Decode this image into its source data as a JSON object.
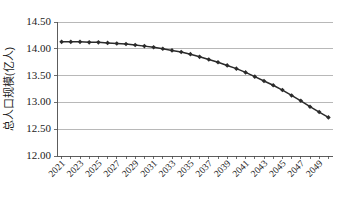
{
  "chart_data": {
    "type": "line",
    "title": "",
    "xlabel": "",
    "ylabel": "总人口规模(亿人)",
    "ylim": [
      12.0,
      14.5
    ],
    "ytick_labels": [
      "12.00",
      "12.50",
      "13.00",
      "13.50",
      "14.00",
      "14.50"
    ],
    "ytick_values": [
      12.0,
      12.5,
      13.0,
      13.5,
      14.0,
      14.5
    ],
    "grid": true,
    "legend": "none",
    "marker": "diamond",
    "line_color": "#2b2b2b",
    "grid_color": "#9a9a9a",
    "x": [
      2021,
      2022,
      2023,
      2024,
      2025,
      2026,
      2027,
      2028,
      2029,
      2030,
      2031,
      2032,
      2033,
      2034,
      2035,
      2036,
      2037,
      2038,
      2039,
      2040,
      2041,
      2042,
      2043,
      2044,
      2045,
      2046,
      2047,
      2048,
      2049,
      2050
    ],
    "xtick_labels": [
      "2021",
      "2023",
      "2025",
      "2027",
      "2029",
      "2031",
      "2033",
      "2035",
      "2037",
      "2039",
      "2041",
      "2043",
      "2045",
      "2047",
      "2049"
    ],
    "xtick_values": [
      2021,
      2023,
      2025,
      2027,
      2029,
      2031,
      2033,
      2035,
      2037,
      2039,
      2041,
      2043,
      2045,
      2047,
      2049
    ],
    "categories": [
      "2021",
      "2022",
      "2023",
      "2024",
      "2025",
      "2026",
      "2027",
      "2028",
      "2029",
      "2030",
      "2031",
      "2032",
      "2033",
      "2034",
      "2035",
      "2036",
      "2037",
      "2038",
      "2039",
      "2040",
      "2041",
      "2042",
      "2043",
      "2044",
      "2045",
      "2046",
      "2047",
      "2048",
      "2049",
      "2050"
    ],
    "values": [
      14.13,
      14.13,
      14.13,
      14.12,
      14.12,
      14.11,
      14.1,
      14.09,
      14.07,
      14.05,
      14.03,
      14.0,
      13.97,
      13.94,
      13.9,
      13.85,
      13.8,
      13.75,
      13.69,
      13.63,
      13.56,
      13.48,
      13.4,
      13.32,
      13.23,
      13.13,
      13.03,
      12.92,
      12.82,
      12.72
    ],
    "series": [
      {
        "name": "总人口规模",
        "values": [
          14.13,
          14.13,
          14.13,
          14.12,
          14.12,
          14.11,
          14.1,
          14.09,
          14.07,
          14.05,
          14.03,
          14.0,
          13.97,
          13.94,
          13.9,
          13.85,
          13.8,
          13.75,
          13.69,
          13.63,
          13.56,
          13.48,
          13.4,
          13.32,
          13.23,
          13.13,
          13.03,
          12.92,
          12.82,
          12.72
        ]
      }
    ]
  },
  "plot": {
    "left": 57,
    "right": 333,
    "top": 22,
    "bottom": 156
  }
}
